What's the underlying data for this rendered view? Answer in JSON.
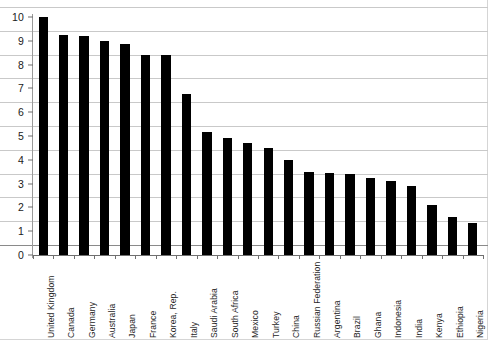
{
  "chart_data": {
    "type": "bar",
    "title": "",
    "subtitle": "",
    "xlabel": "",
    "ylabel": "",
    "ylim": [
      0,
      10
    ],
    "y_ticks": [
      0,
      1,
      2,
      3,
      4,
      5,
      6,
      7,
      8,
      9,
      10
    ],
    "grid": true,
    "legend": false,
    "bar_color": "#000000",
    "grid_color": "#c9c9c9",
    "axis_color": "#6f6f6f",
    "categories": [
      "United Kingdom",
      "Canada",
      "Germany",
      "Australia",
      "Japan",
      "France",
      "Korea, Rep.",
      "Italy",
      "Saudi Arabia",
      "South Africa",
      "Mexico",
      "Turkey",
      "China",
      "Russian Federation",
      "Argentina",
      "Brazil",
      "Ghana",
      "Indonesia",
      "India",
      "Kenya",
      "Ethiopia",
      "Nigeria"
    ],
    "values": [
      10.0,
      9.25,
      9.2,
      9.0,
      8.85,
      8.4,
      8.4,
      6.75,
      5.15,
      4.9,
      4.7,
      4.5,
      4.0,
      3.5,
      3.45,
      3.4,
      3.25,
      3.1,
      2.9,
      2.1,
      1.6,
      1.35
    ]
  }
}
